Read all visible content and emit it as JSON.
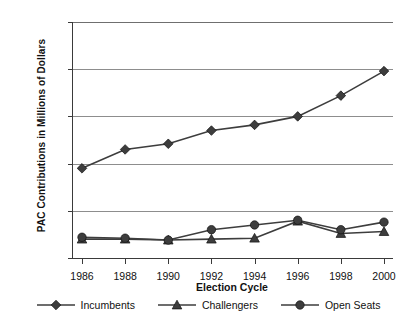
{
  "chart_data": {
    "type": "line",
    "title": "",
    "xlabel": "Election Cycle",
    "ylabel": "PAC Contributions in Millions of Dollars",
    "categories": [
      "1986",
      "1988",
      "1990",
      "1992",
      "1994",
      "1996",
      "1998",
      "2000"
    ],
    "x": [
      1986,
      1988,
      1990,
      1992,
      1994,
      1996,
      1998,
      2000
    ],
    "ylim": [
      0,
      250
    ],
    "yticks": [
      0,
      50,
      100,
      150,
      200,
      250
    ],
    "ytick_labels": [
      "0",
      "50",
      "100",
      "150",
      "200",
      "250"
    ],
    "grid": true,
    "legend_position": "bottom",
    "series": [
      {
        "name": "Incumbents",
        "marker": "diamond",
        "color": "#3d3d3d",
        "values": [
          95,
          115,
          121,
          135,
          141,
          150,
          172,
          198
        ]
      },
      {
        "name": "Challengers",
        "marker": "triangle",
        "color": "#3d3d3d",
        "values": [
          20,
          20,
          19,
          20,
          21,
          39,
          26,
          28
        ]
      },
      {
        "name": "Open Seats",
        "marker": "circle",
        "color": "#3d3d3d",
        "values": [
          22,
          21,
          19,
          30,
          35,
          40,
          30,
          38
        ]
      }
    ]
  },
  "legend": {
    "items": [
      {
        "label": "Incumbents",
        "marker": "diamond"
      },
      {
        "label": "Challengers",
        "marker": "triangle"
      },
      {
        "label": "Open Seats",
        "marker": "circle"
      }
    ]
  },
  "colors": {
    "series": "#3d3d3d",
    "axis": "#3a3a3a",
    "grid": "#8d8d8d",
    "background": "#ffffff"
  }
}
